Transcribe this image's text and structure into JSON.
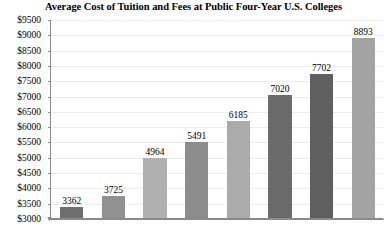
{
  "chart_data": {
    "type": "bar",
    "title": "Average Cost of Tuition and Fees at Public Four-Year U.S. Colleges",
    "xlabel": "",
    "ylabel": "",
    "categories": [
      "",
      "",
      "",
      "",
      "",
      "",
      "",
      ""
    ],
    "values": [
      3362,
      3725,
      4964,
      5491,
      6185,
      7020,
      7702,
      8893
    ],
    "value_labels": [
      "3362",
      "3725",
      "4964",
      "5491",
      "6185",
      "7020",
      "7702",
      "8893"
    ],
    "bar_colors": [
      "#6e6e6e",
      "#919191",
      "#b0b0b0",
      "#8c8c8c",
      "#ababab",
      "#6b6b6b",
      "#5f5f5f",
      "#a3a3a3"
    ],
    "ylim": [
      3000,
      9500
    ],
    "ytick_values": [
      3000,
      3500,
      4000,
      4500,
      5000,
      5500,
      6000,
      6500,
      7000,
      7500,
      8000,
      8500,
      9000,
      9500
    ],
    "ytick_labels": [
      "$3000",
      "$3500",
      "$4000",
      "$4500",
      "$5000",
      "$5500",
      "$6000",
      "$6500",
      "$7000",
      "$7500",
      "$8000",
      "$8500",
      "$9000",
      "$9500"
    ],
    "grid": true,
    "grid_color": "#ededed",
    "legend": null,
    "axis_color": "#8a8a8a",
    "background": "#ffffff"
  }
}
